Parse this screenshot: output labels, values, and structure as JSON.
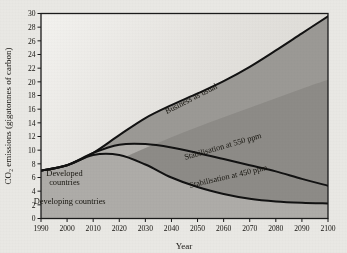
{
  "chart_data": {
    "type": "area",
    "title": "",
    "xlabel": "Year",
    "ylabel": "CO₂ emissions (gigatonnes of carbon)",
    "xlim": [
      1990,
      2100
    ],
    "ylim": [
      0,
      30
    ],
    "xticks": [
      1990,
      2000,
      2010,
      2020,
      2030,
      2040,
      2050,
      2060,
      2070,
      2080,
      2090,
      2100
    ],
    "yticks": [
      0,
      2,
      4,
      6,
      8,
      10,
      12,
      14,
      16,
      18,
      20,
      22,
      24,
      26,
      28,
      30
    ],
    "grid": false,
    "legend_position": "inline-annotations",
    "x": [
      1990,
      2000,
      2010,
      2020,
      2030,
      2040,
      2050,
      2060,
      2070,
      2080,
      2090,
      2100
    ],
    "series": [
      {
        "name": "Business as usual",
        "label": "Business as usual",
        "values": [
          7.0,
          7.8,
          9.6,
          12.2,
          14.7,
          16.6,
          18.3,
          20.1,
          22.2,
          24.6,
          27.1,
          29.6
        ]
      },
      {
        "name": "Stabilisation at 550 ppm",
        "label": "Stabilisation at 550 ppm",
        "values": [
          7.0,
          7.8,
          9.6,
          10.8,
          10.9,
          10.4,
          9.6,
          8.7,
          7.8,
          6.9,
          5.8,
          4.8
        ]
      },
      {
        "name": "Stabilisation at 450 ppm",
        "label": "Stabilisation at 450 ppm",
        "values": [
          7.0,
          7.8,
          9.3,
          9.3,
          7.9,
          6.0,
          4.6,
          3.6,
          2.9,
          2.5,
          2.3,
          2.2
        ]
      },
      {
        "name": "Developed countries boundary",
        "label": "Developed countries",
        "values": [
          3.6,
          5.1,
          6.8,
          8.6,
          10.3,
          11.9,
          13.4,
          14.8,
          16.2,
          17.6,
          19.0,
          20.3
        ]
      }
    ],
    "regions": [
      {
        "name": "developed-countries",
        "label": "Developed countries",
        "color": "#8e8c88"
      },
      {
        "name": "developing-countries",
        "label": "Developing countries",
        "color": "#b1afab"
      }
    ],
    "annotations": [
      {
        "name": "business-as-usual",
        "text": "Business as usual",
        "x": 2048,
        "y": 17.2,
        "rotation": -27
      },
      {
        "name": "stabilisation-550",
        "text": "Stabilisation at 550 ppm",
        "x": 2060,
        "y": 10.2,
        "rotation": -16
      },
      {
        "name": "stabilisation-450",
        "text": "Stabilisation at 450 ppm",
        "x": 2062,
        "y": 5.8,
        "rotation": -13
      },
      {
        "name": "developed-countries",
        "text": "Developed",
        "text2": "countries",
        "x": 1999,
        "y": 6.2,
        "rotation": 0
      },
      {
        "name": "developing-countries",
        "text": "Developing countries",
        "x": 2001,
        "y": 2.1,
        "rotation": 0
      }
    ],
    "colors": {
      "background": "#e9e8e4",
      "plot_background": "#dedcd7",
      "band_upper": "#9b9995",
      "band_lower": "#b1afab",
      "developed_wedge": "#8e8c88",
      "line": "#121212",
      "text": "#15130f"
    }
  },
  "axes": {
    "y_title": "CO₂ emissions (gigatonnes of carbon)",
    "x_title": "Year",
    "y_labels": [
      "0",
      "2",
      "4",
      "6",
      "8",
      "10",
      "12",
      "14",
      "16",
      "18",
      "20",
      "22",
      "24",
      "26",
      "28",
      "30"
    ],
    "x_labels": [
      "1990",
      "2000",
      "2010",
      "2020",
      "2030",
      "2040",
      "2050",
      "2060",
      "2070",
      "2080",
      "2090",
      "2100"
    ]
  }
}
